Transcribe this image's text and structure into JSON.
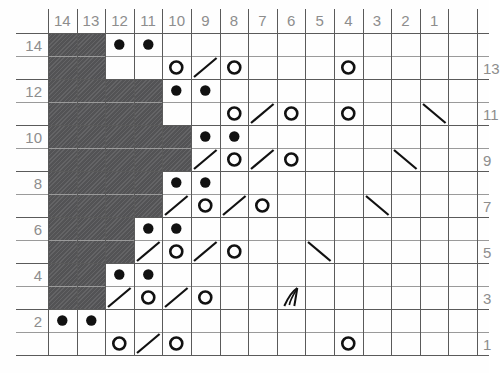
{
  "chart_title": "Knitting Stitch Chart",
  "grid": {
    "columns": 14,
    "rows": 14,
    "column_headers": [
      "14",
      "13",
      "12",
      "11",
      "10",
      "9",
      "8",
      "7",
      "6",
      "5",
      "4",
      "3",
      "2",
      "1"
    ],
    "row_labels_left": [
      "14",
      "12",
      "10",
      "8",
      "6",
      "4",
      "2"
    ],
    "row_labels_right": [
      "13",
      "11",
      "9",
      "7",
      "5",
      "3",
      "1"
    ],
    "label_color": "#8d8d8d",
    "grid_line_color": "#5a5a5a",
    "shaded_cell_color": "#58585a",
    "symbol_color": "#111111",
    "background_color": "#ffffff"
  },
  "legend_symbols": {
    "shaded": "no-stitch-block",
    "dot": "purl-stitch",
    "circle": "yarn-over",
    "slash-right": "k2tog-right-leaning-decrease",
    "slash-left": "ssk-left-leaning-decrease",
    "gather": "gathered-stitch-cluster"
  },
  "chart_data": {
    "type": "heatmap",
    "xlabel": "Stitch number",
    "ylabel": "Row number",
    "categories": [
      "14",
      "13",
      "12",
      "11",
      "10",
      "9",
      "8",
      "7",
      "6",
      "5",
      "4",
      "3",
      "2",
      "1"
    ],
    "x": [
      14,
      13,
      12,
      11,
      10,
      9,
      8,
      7,
      6,
      5,
      4,
      3,
      2,
      1
    ],
    "ylim": [
      1,
      14
    ],
    "grid": true,
    "legend": "none",
    "rows": [
      {
        "row": 14,
        "side": "left",
        "shaded": [
          14,
          13
        ],
        "symbols": {
          "12": "dot",
          "11": "dot"
        }
      },
      {
        "row": 13,
        "side": "right",
        "shaded": [
          14,
          13
        ],
        "symbols": {
          "10": "circle",
          "9": "slash-right",
          "8": "circle",
          "4": "circle"
        }
      },
      {
        "row": 12,
        "side": "left",
        "shaded": [
          14,
          13,
          12,
          11
        ],
        "symbols": {
          "10": "dot",
          "9": "dot"
        }
      },
      {
        "row": 11,
        "side": "right",
        "shaded": [
          14,
          13,
          12,
          11
        ],
        "symbols": {
          "8": "circle",
          "7": "slash-right",
          "6": "circle",
          "4": "circle",
          "1": "slash-left"
        }
      },
      {
        "row": 10,
        "side": "left",
        "shaded": [
          14,
          13,
          12,
          11,
          10
        ],
        "symbols": {
          "9": "dot",
          "8": "dot"
        }
      },
      {
        "row": 9,
        "side": "right",
        "shaded": [
          14,
          13,
          12,
          11,
          10
        ],
        "symbols": {
          "9": "slash-right",
          "8": "circle",
          "7": "slash-right",
          "6": "circle",
          "2": "slash-left"
        }
      },
      {
        "row": 8,
        "side": "left",
        "shaded": [
          14,
          13,
          12,
          11
        ],
        "symbols": {
          "10": "dot",
          "9": "dot"
        }
      },
      {
        "row": 7,
        "side": "right",
        "shaded": [
          14,
          13,
          12,
          11
        ],
        "symbols": {
          "10": "slash-right",
          "9": "circle",
          "8": "slash-right",
          "7": "circle",
          "3": "slash-left"
        }
      },
      {
        "row": 6,
        "side": "left",
        "shaded": [
          14,
          13,
          12
        ],
        "symbols": {
          "11": "dot",
          "10": "dot"
        }
      },
      {
        "row": 5,
        "side": "right",
        "shaded": [
          14,
          13,
          12
        ],
        "symbols": {
          "11": "slash-right",
          "10": "circle",
          "9": "slash-right",
          "8": "circle",
          "5": "slash-left"
        }
      },
      {
        "row": 4,
        "side": "left",
        "shaded": [
          14,
          13
        ],
        "symbols": {
          "12": "dot",
          "11": "dot"
        }
      },
      {
        "row": 3,
        "side": "right",
        "shaded": [
          14,
          13
        ],
        "symbols": {
          "12": "slash-right",
          "11": "circle",
          "10": "slash-right",
          "9": "circle",
          "6": "gather"
        }
      },
      {
        "row": 2,
        "side": "left",
        "shaded": [],
        "symbols": {
          "14": "dot",
          "13": "dot"
        }
      },
      {
        "row": 1,
        "side": "right",
        "shaded": [],
        "symbols": {
          "12": "circle",
          "11": "slash-right",
          "10": "circle",
          "4": "circle"
        }
      }
    ]
  }
}
